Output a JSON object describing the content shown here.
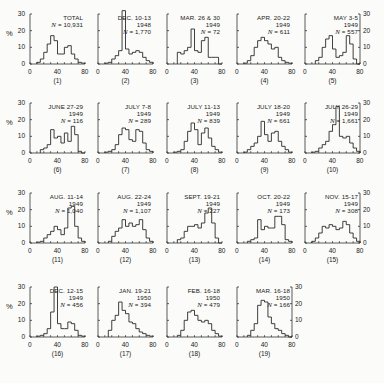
{
  "figure": {
    "y_unit_label": "%",
    "x_ticks": [
      "0",
      "40",
      "80"
    ],
    "y_ticks": [
      "0",
      "10",
      "20",
      "30"
    ]
  },
  "chart_data": [
    {
      "type": "bar",
      "panel": "(1)",
      "title": "TOTAL",
      "year": "",
      "n_label": "N = 10,931",
      "xlim": [
        0,
        80
      ],
      "ylim": [
        0,
        30
      ],
      "xlabel": "",
      "ylabel": "%",
      "bin_width": 5,
      "x": [
        10,
        15,
        20,
        25,
        30,
        35,
        40,
        45,
        50,
        55,
        60,
        65,
        70,
        75
      ],
      "values": [
        1,
        3,
        7,
        12,
        17,
        14,
        6,
        6,
        10,
        11,
        6,
        3,
        1,
        0.5
      ]
    },
    {
      "type": "bar",
      "panel": "(2)",
      "title": "DEC. 10-13",
      "year": "1948",
      "n_label": "N = 1,770",
      "xlim": [
        0,
        80
      ],
      "ylim": [
        0,
        30
      ],
      "ylabel": "%",
      "bin_width": 5,
      "x": [
        10,
        15,
        20,
        25,
        30,
        35,
        40,
        45,
        50,
        55,
        60,
        65,
        70,
        75
      ],
      "values": [
        0.5,
        1,
        3,
        5,
        8,
        32,
        9,
        6,
        7,
        8,
        7,
        4,
        2,
        1
      ]
    },
    {
      "type": "bar",
      "panel": "(3)",
      "title": "MAR. 26 & 30",
      "year": "1949",
      "n_label": "N = 72",
      "xlim": [
        0,
        80
      ],
      "ylim": [
        0,
        30
      ],
      "ylabel": "%",
      "bin_width": 5,
      "x": [
        15,
        20,
        25,
        30,
        35,
        40,
        45,
        50,
        55,
        60,
        65,
        70,
        75
      ],
      "values": [
        7,
        6,
        8,
        10,
        21,
        8,
        7,
        14,
        16,
        4,
        4,
        4,
        0
      ]
    },
    {
      "type": "bar",
      "panel": "(4)",
      "title": "APR. 20-22",
      "year": "1949",
      "n_label": "N = 611",
      "xlim": [
        0,
        80
      ],
      "ylim": [
        0,
        30
      ],
      "ylabel": "%",
      "bin_width": 5,
      "x": [
        10,
        15,
        20,
        25,
        30,
        35,
        40,
        45,
        50,
        55,
        60,
        65,
        70,
        75
      ],
      "values": [
        0.5,
        2,
        5,
        10,
        14,
        16,
        14,
        12,
        9,
        10,
        4,
        2,
        1,
        0.5
      ]
    },
    {
      "type": "bar",
      "panel": "(5)",
      "title": "MAY 3-5",
      "year": "1949",
      "n_label": "N = 557",
      "xlim": [
        0,
        80
      ],
      "ylim": [
        0,
        30
      ],
      "ylabel": "%",
      "bin_width": 5,
      "x": [
        15,
        20,
        25,
        30,
        35,
        40,
        45,
        50,
        55,
        60,
        65,
        70,
        75
      ],
      "values": [
        2,
        4,
        10,
        15,
        17,
        9,
        4,
        5,
        7,
        17,
        12,
        3,
        0
      ]
    },
    {
      "type": "bar",
      "panel": "(6)",
      "title": "JUNE 27-29",
      "year": "1949",
      "n_label": "N = 116",
      "xlim": [
        0,
        80
      ],
      "ylim": [
        0,
        30
      ],
      "ylabel": "%",
      "bin_width": 5,
      "x": [
        15,
        20,
        25,
        30,
        35,
        40,
        45,
        50,
        55,
        60,
        65,
        70,
        75
      ],
      "values": [
        2,
        3,
        5,
        14,
        9,
        10,
        6,
        12,
        7,
        16,
        11,
        1,
        0
      ]
    },
    {
      "type": "bar",
      "panel": "(7)",
      "title": "JULY 7-8",
      "year": "1949",
      "n_label": "N = 289",
      "xlim": [
        0,
        80
      ],
      "ylim": [
        0,
        30
      ],
      "ylabel": "%",
      "bin_width": 5,
      "x": [
        10,
        15,
        20,
        25,
        30,
        35,
        40,
        45,
        50,
        55,
        60,
        65,
        70,
        75
      ],
      "values": [
        0.5,
        1,
        2,
        5,
        11,
        15,
        14,
        8,
        7,
        14,
        13,
        6,
        2,
        1
      ]
    },
    {
      "type": "bar",
      "panel": "(8)",
      "title": "JULY 11-13",
      "year": "1949",
      "n_label": "N = 839",
      "xlim": [
        0,
        80
      ],
      "ylim": [
        0,
        30
      ],
      "ylabel": "%",
      "bin_width": 5,
      "x": [
        10,
        15,
        20,
        25,
        30,
        35,
        40,
        45,
        50,
        55,
        60,
        65,
        70,
        75
      ],
      "values": [
        0.5,
        1,
        2,
        7,
        13,
        18,
        14,
        5,
        12,
        15,
        9,
        4,
        2,
        0.5
      ]
    },
    {
      "type": "bar",
      "panel": "(9)",
      "title": "JULY 18-20",
      "year": "1949",
      "n_label": "N = 661",
      "xlim": [
        0,
        80
      ],
      "ylim": [
        0,
        30
      ],
      "ylabel": "%",
      "bin_width": 5,
      "x": [
        10,
        15,
        20,
        25,
        30,
        35,
        40,
        45,
        50,
        55,
        60,
        65,
        70,
        75
      ],
      "values": [
        0.5,
        2,
        4,
        6,
        10,
        19,
        11,
        7,
        12,
        13,
        7,
        4,
        2,
        0.5
      ]
    },
    {
      "type": "bar",
      "panel": "(10)",
      "title": "JULY 26-29",
      "year": "1949",
      "n_label": "N = 1,661",
      "xlim": [
        0,
        80
      ],
      "ylim": [
        0,
        30
      ],
      "ylabel": "%",
      "bin_width": 5,
      "x": [
        10,
        15,
        20,
        25,
        30,
        35,
        40,
        45,
        50,
        55,
        60,
        65,
        70,
        75
      ],
      "values": [
        0.5,
        1,
        3,
        5,
        7,
        13,
        17,
        28,
        10,
        9,
        10,
        6,
        3,
        1
      ]
    },
    {
      "type": "bar",
      "panel": "(11)",
      "title": "AUG. 11-14",
      "year": "1949",
      "n_label": "N = 1,040",
      "xlim": [
        0,
        80
      ],
      "ylim": [
        0,
        30
      ],
      "ylabel": "%",
      "bin_width": 5,
      "x": [
        10,
        15,
        20,
        25,
        30,
        35,
        40,
        45,
        50,
        55,
        60,
        65,
        70,
        75
      ],
      "values": [
        0.5,
        1,
        3,
        5,
        7,
        10,
        8,
        5,
        9,
        21,
        22,
        10,
        3,
        1
      ]
    },
    {
      "type": "bar",
      "panel": "(12)",
      "title": "AUG. 22-24",
      "year": "1949",
      "n_label": "N = 1,107",
      "xlim": [
        0,
        80
      ],
      "ylim": [
        0,
        30
      ],
      "ylabel": "%",
      "bin_width": 5,
      "x": [
        15,
        20,
        25,
        30,
        35,
        40,
        45,
        50,
        55,
        60,
        65,
        70,
        75
      ],
      "values": [
        1,
        4,
        7,
        9,
        14,
        10,
        12,
        10,
        11,
        14,
        8,
        3,
        1
      ]
    },
    {
      "type": "bar",
      "panel": "(13)",
      "title": "SEPT. 19-21",
      "year": "1949",
      "n_label": "N = 227",
      "xlim": [
        0,
        80
      ],
      "ylim": [
        0,
        30
      ],
      "ylabel": "%",
      "bin_width": 5,
      "x": [
        15,
        20,
        25,
        30,
        35,
        40,
        45,
        50,
        55,
        60,
        65,
        70,
        75
      ],
      "values": [
        2,
        3,
        7,
        10,
        10,
        11,
        9,
        12,
        18,
        21,
        12,
        3,
        0
      ]
    },
    {
      "type": "bar",
      "panel": "(14)",
      "title": "OCT. 20-22",
      "year": "1949",
      "n_label": "N = 173",
      "xlim": [
        0,
        80
      ],
      "ylim": [
        0,
        30
      ],
      "ylabel": "%",
      "bin_width": 5,
      "x": [
        15,
        20,
        25,
        30,
        35,
        40,
        45,
        50,
        55,
        60,
        65,
        70,
        75
      ],
      "values": [
        1,
        2,
        3,
        14,
        8,
        10,
        9,
        9,
        16,
        16,
        11,
        2,
        1
      ]
    },
    {
      "type": "bar",
      "panel": "(15)",
      "title": "NOV. 15-17",
      "year": "1949",
      "n_label": "N = 308",
      "xlim": [
        0,
        80
      ],
      "ylim": [
        0,
        30
      ],
      "ylabel": "%",
      "bin_width": 5,
      "x": [
        10,
        15,
        20,
        25,
        30,
        35,
        40,
        45,
        50,
        55,
        60,
        65,
        70,
        75
      ],
      "values": [
        1,
        3,
        6,
        10,
        9,
        11,
        10,
        8,
        9,
        13,
        11,
        6,
        3,
        1
      ]
    },
    {
      "type": "bar",
      "panel": "(16)",
      "title": "DEC. 12-15",
      "year": "1949",
      "n_label": "N = 456",
      "xlim": [
        0,
        80
      ],
      "ylim": [
        0,
        30
      ],
      "ylabel": "%",
      "bin_width": 5,
      "x": [
        10,
        15,
        20,
        25,
        30,
        35,
        40,
        45,
        50,
        55,
        60,
        65,
        70,
        75
      ],
      "values": [
        0.5,
        1,
        2,
        5,
        15,
        30,
        8,
        5,
        5,
        9,
        8,
        4,
        1,
        0.5
      ]
    },
    {
      "type": "bar",
      "panel": "(17)",
      "title": "JAN. 19-21",
      "year": "1950",
      "n_label": "N = 394",
      "xlim": [
        0,
        80
      ],
      "ylim": [
        0,
        30
      ],
      "ylabel": "%",
      "bin_width": 5,
      "x": [
        15,
        20,
        25,
        30,
        35,
        40,
        45,
        50,
        55,
        60,
        65,
        70,
        75
      ],
      "values": [
        4,
        10,
        13,
        21,
        16,
        14,
        9,
        8,
        5,
        3,
        2,
        1,
        0.5
      ]
    },
    {
      "type": "bar",
      "panel": "(18)",
      "title": "FEB. 16-18",
      "year": "1950",
      "n_label": "N = 479",
      "xlim": [
        0,
        80
      ],
      "ylim": [
        0,
        30
      ],
      "ylabel": "%",
      "bin_width": 5,
      "x": [
        15,
        20,
        25,
        30,
        35,
        40,
        45,
        50,
        55,
        60,
        65,
        70,
        75
      ],
      "values": [
        1,
        4,
        10,
        15,
        16,
        13,
        10,
        9,
        10,
        8,
        4,
        2,
        0.5
      ]
    },
    {
      "type": "bar",
      "panel": "(19)",
      "title": "MAR. 16-18",
      "year": "1950",
      "n_label": "N = 166",
      "xlim": [
        0,
        80
      ],
      "ylim": [
        0,
        30
      ],
      "ylabel": "%",
      "bin_width": 5,
      "x": [
        15,
        20,
        25,
        30,
        35,
        40,
        45,
        50,
        55,
        60,
        65,
        70,
        75
      ],
      "values": [
        1,
        4,
        8,
        19,
        22,
        21,
        12,
        8,
        5,
        4,
        2,
        1,
        0
      ]
    }
  ]
}
